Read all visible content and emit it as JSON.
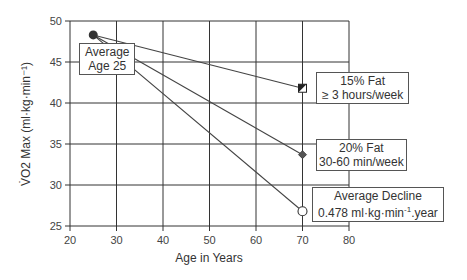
{
  "chart_data": {
    "type": "line",
    "title": "",
    "xlabel": "Age in Years",
    "ylabel": "V̇O2 Max (ml·kg·min⁻¹)",
    "xlim": [
      20,
      80
    ],
    "ylim": [
      25,
      50
    ],
    "xticks": [
      20,
      30,
      40,
      50,
      60,
      70,
      80
    ],
    "yticks": [
      25,
      30,
      35,
      40,
      45,
      50
    ],
    "grid": true,
    "origin": {
      "x": 25,
      "y": 48.3,
      "marker": "filled-circle"
    },
    "series": [
      {
        "name": "15% Fat ≥ 3 hours/week",
        "points": [
          [
            25,
            48.3
          ],
          [
            70,
            41.8
          ]
        ],
        "marker": "half-filled-square"
      },
      {
        "name": "20% Fat 30-60 min/week",
        "points": [
          [
            25,
            48.3
          ],
          [
            70,
            33.7
          ]
        ],
        "marker": "diamond"
      },
      {
        "name": "Average Decline",
        "points": [
          [
            25,
            48.3
          ],
          [
            70,
            26.8
          ]
        ],
        "marker": "open-circle"
      }
    ],
    "annotations": [
      {
        "id": "age25",
        "lines": [
          "Average",
          "Age 25"
        ]
      },
      {
        "id": "fat15",
        "lines": [
          "15% Fat",
          "≥ 3 hours/week"
        ]
      },
      {
        "id": "fat20",
        "lines": [
          "20% Fat",
          "30-60 min/week"
        ]
      },
      {
        "id": "decline",
        "lines": [
          "Average Decline",
          "0.478 ml·kg·min",
          "-1",
          ".year"
        ]
      }
    ]
  }
}
